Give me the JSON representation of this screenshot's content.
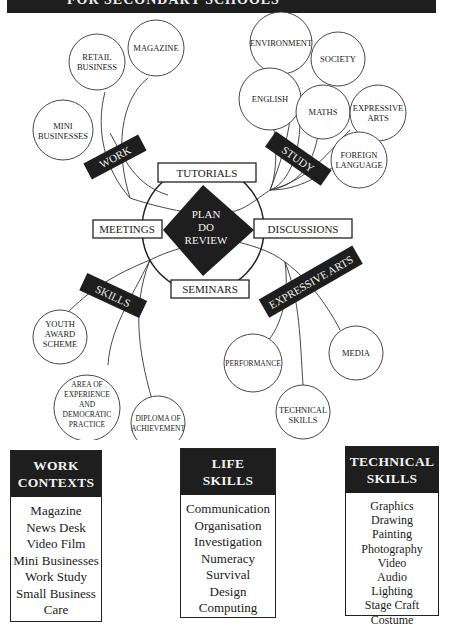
{
  "banner": {
    "title": "FOR SECONDARY SCHOOLS"
  },
  "hub": {
    "center": [
      "PLAN",
      "DO",
      "REVIEW"
    ],
    "activities": {
      "top": "TUTORIALS",
      "left": "MEETINGS",
      "right": "DISCUSSIONS",
      "bottom": "SEMINARS"
    }
  },
  "branches": {
    "work": {
      "label": "WORK",
      "nodes": [
        {
          "lines": [
            "MAGAZINE"
          ]
        },
        {
          "lines": [
            "RETAIL",
            "BUSINESS"
          ]
        },
        {
          "lines": [
            "MINI",
            "BUSINESSES"
          ]
        }
      ]
    },
    "study": {
      "label": "STUDY",
      "nodes": [
        {
          "lines": [
            "ENVIRONMENT"
          ]
        },
        {
          "lines": [
            "SOCIETY"
          ]
        },
        {
          "lines": [
            "ENGLISH"
          ]
        },
        {
          "lines": [
            "MATHS"
          ]
        },
        {
          "lines": [
            "EXPRESSIVE",
            "ARTS"
          ]
        },
        {
          "lines": [
            "FOREIGN",
            "LANGUAGE"
          ]
        }
      ]
    },
    "skills": {
      "label": "SKILLS",
      "nodes": [
        {
          "lines": [
            "YOUTH",
            "AWARD",
            "SCHEME"
          ]
        },
        {
          "lines": [
            "AREA OF",
            "EXPERIENCE",
            "AND",
            "DEMOCRATIC",
            "PRACTICE"
          ]
        },
        {
          "lines": [
            "DIPLOMA OF",
            "ACHIEVEMENT"
          ]
        }
      ]
    },
    "expressive_arts": {
      "label": "EXPRESSIVE ARTS",
      "nodes": [
        {
          "lines": [
            "PERFORMANCE"
          ]
        },
        {
          "lines": [
            "TECHNICAL",
            "SKILLS"
          ]
        },
        {
          "lines": [
            "MEDIA"
          ]
        }
      ]
    }
  },
  "panels": {
    "work_contexts": {
      "title": [
        "WORK",
        "CONTEXTS"
      ],
      "items": [
        "Magazine",
        "News Desk",
        "Video Film",
        "Mini Businesses",
        "Work Study",
        "Small Business",
        "Care"
      ]
    },
    "life_skills": {
      "title": [
        "LIFE",
        "SKILLS"
      ],
      "items": [
        "Communication",
        "Organisation",
        "Investigation",
        "Numeracy",
        "Survival",
        "Design",
        "Computing"
      ]
    },
    "technical_skills": {
      "title": [
        "TECHNICAL",
        "SKILLS"
      ],
      "items": [
        "Graphics",
        "Drawing",
        "Painting",
        "Photography",
        "Video",
        "Audio",
        "Lighting",
        "Stage Craft",
        "Costume"
      ]
    }
  },
  "colors": {
    "ink": "#1e1e1e",
    "paper": "#ffffff"
  }
}
